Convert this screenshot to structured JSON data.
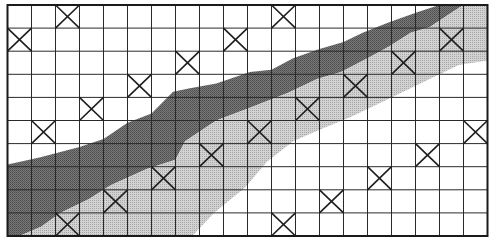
{
  "figure": {
    "type": "grid-diagram",
    "grid": {
      "columns": 20,
      "rows": 10
    },
    "colors": {
      "background": "#ffffff",
      "grid_line": "#2a2a2a",
      "border": "#1a1a1a",
      "dark_band": "#6e6e6e",
      "light_band": "#c4c4c4",
      "cross": "#1e1e1e"
    },
    "crossed_cells": [
      {
        "row": 0,
        "col": 2
      },
      {
        "row": 0,
        "col": 11
      },
      {
        "row": 1,
        "col": 0
      },
      {
        "row": 1,
        "col": 9
      },
      {
        "row": 1,
        "col": 18
      },
      {
        "row": 2,
        "col": 7
      },
      {
        "row": 2,
        "col": 16
      },
      {
        "row": 3,
        "col": 5
      },
      {
        "row": 3,
        "col": 14
      },
      {
        "row": 4,
        "col": 3
      },
      {
        "row": 4,
        "col": 12
      },
      {
        "row": 5,
        "col": 1
      },
      {
        "row": 5,
        "col": 10
      },
      {
        "row": 5,
        "col": 19
      },
      {
        "row": 6,
        "col": 8
      },
      {
        "row": 6,
        "col": 17
      },
      {
        "row": 7,
        "col": 6
      },
      {
        "row": 7,
        "col": 15
      },
      {
        "row": 8,
        "col": 4
      },
      {
        "row": 8,
        "col": 13
      },
      {
        "row": 9,
        "col": 2
      },
      {
        "row": 9,
        "col": 11
      }
    ],
    "bands": [
      {
        "name": "dark-band",
        "shade": "dark",
        "upper_edge": [
          [
            0,
            6.9
          ],
          [
            1.33,
            6.6
          ],
          [
            3,
            6.15
          ],
          [
            4,
            5.8
          ],
          [
            5,
            5.1
          ],
          [
            6,
            4.7
          ],
          [
            6.9,
            3.75
          ],
          [
            7.6,
            3.6
          ],
          [
            8.7,
            3.4
          ],
          [
            10.1,
            2.9
          ],
          [
            11,
            2.8
          ],
          [
            11.9,
            2.3
          ],
          [
            13,
            1.9
          ],
          [
            14,
            1.6
          ],
          [
            14.8,
            1.2
          ],
          [
            15.9,
            0.75
          ],
          [
            17.1,
            0.3
          ],
          [
            18,
            0
          ],
          [
            20,
            0
          ]
        ],
        "lower_edge": [
          [
            0.5,
            10
          ],
          [
            1.4,
            9.6
          ],
          [
            2.2,
            9.0
          ],
          [
            3.4,
            8.4
          ],
          [
            4.3,
            7.8
          ],
          [
            5.8,
            7.1
          ],
          [
            7,
            6.7
          ],
          [
            7.4,
            5.9
          ],
          [
            8.7,
            5.0
          ],
          [
            10.1,
            4.45
          ],
          [
            11.7,
            3.8
          ],
          [
            12.9,
            3.2
          ],
          [
            13.9,
            2.9
          ],
          [
            15.1,
            2.25
          ],
          [
            15.9,
            1.8
          ],
          [
            16.8,
            1.2
          ],
          [
            17.6,
            0.95
          ],
          [
            18.7,
            0.2
          ],
          [
            19,
            0
          ]
        ]
      },
      {
        "name": "light-band",
        "shade": "light",
        "upper_edge": [
          [
            0.5,
            10
          ],
          [
            1.4,
            9.6
          ],
          [
            2.2,
            9.0
          ],
          [
            3.4,
            8.4
          ],
          [
            4.3,
            7.8
          ],
          [
            5.8,
            7.1
          ],
          [
            7,
            6.7
          ],
          [
            7.4,
            5.9
          ],
          [
            8.7,
            5.0
          ],
          [
            10.1,
            4.45
          ],
          [
            11.7,
            3.8
          ],
          [
            12.9,
            3.2
          ],
          [
            13.9,
            2.9
          ],
          [
            15.1,
            2.25
          ],
          [
            15.9,
            1.8
          ],
          [
            16.8,
            1.2
          ],
          [
            17.6,
            0.95
          ],
          [
            18.7,
            0.2
          ],
          [
            19,
            0
          ],
          [
            20,
            0
          ]
        ],
        "lower_edge": [
          [
            7.7,
            10
          ],
          [
            8.6,
            9.0
          ],
          [
            9.9,
            7.9
          ],
          [
            10.8,
            6.8
          ],
          [
            11.9,
            5.9
          ],
          [
            13.0,
            5.4
          ],
          [
            14.3,
            4.85
          ],
          [
            15.8,
            4.1
          ],
          [
            17.4,
            3.3
          ],
          [
            18.8,
            2.6
          ],
          [
            20,
            2.4
          ]
        ]
      }
    ]
  }
}
